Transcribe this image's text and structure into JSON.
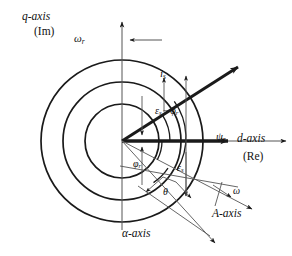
{
  "figure": {
    "name": "space-vector-phasor-diagram",
    "background_color": "#ffffff",
    "line_color": "#1a1a1a",
    "thin_line_color": "#888888",
    "width": 292,
    "height": 256
  },
  "axes": {
    "q_axis": {
      "label": "q-axis",
      "unit_label": "(Im)",
      "direction": "vertical-up"
    },
    "d_axis": {
      "label": "d-axis",
      "unit_label": "(Re)",
      "direction": "horizontal-right"
    },
    "alpha_axis": {
      "label": "α-axis",
      "direction": "lower-right"
    },
    "A_axis": {
      "label": "A-axis",
      "direction": "lower-right"
    }
  },
  "vectors": [
    {
      "name": "stator-current-vector",
      "label": "i",
      "subscript": "s",
      "style": "thick-arrow"
    },
    {
      "name": "rotor-flux-vector",
      "label": "ψ",
      "subscript": "r",
      "style": "thick-arrow"
    }
  ],
  "angles": [
    {
      "name": "epsilon-s-minus-phi-r",
      "label": "ε",
      "subscript": "s",
      "operator": "−",
      "label2": "φ",
      "subscript2": "r"
    },
    {
      "name": "phi-r-angle",
      "label": "φ",
      "subscript": "r"
    },
    {
      "name": "epsilon-s-angle",
      "label": "ε",
      "subscript": "s"
    },
    {
      "name": "theta-angle",
      "label": "θ"
    }
  ],
  "speeds": [
    {
      "name": "rotor-angular-speed",
      "label": "ω",
      "subscript": "r",
      "arrow": "left"
    },
    {
      "name": "mechanical-angular-speed",
      "label": "ω",
      "arrow": "lower-right"
    }
  ],
  "circles": {
    "count": 3,
    "radii": [
      37,
      59,
      81
    ],
    "center": {
      "x": 122,
      "y": 141
    }
  }
}
